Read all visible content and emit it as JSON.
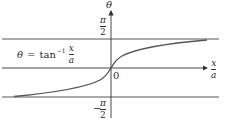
{
  "figure": {
    "equation": {
      "lhs": "θ",
      "equals": "=",
      "func": "tan",
      "superscript": "−1",
      "numerator": "x",
      "denominator": "a"
    },
    "y_axis": {
      "label": "θ"
    },
    "x_axis": {
      "numerator": "x",
      "denominator": "a"
    },
    "origin_label": "0",
    "upper_asymptote": {
      "numerator": "π",
      "denominator": "2"
    },
    "lower_asymptote": {
      "sign": "−",
      "numerator": "π",
      "denominator": "2"
    },
    "colors": {
      "curve": "#555555",
      "axes": "#333333",
      "lines": "#444444"
    }
  }
}
